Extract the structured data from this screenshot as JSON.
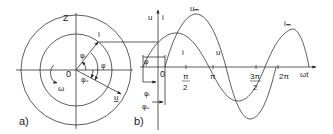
{
  "figure_a": {
    "panel_label": "a)",
    "z_label": "Z",
    "origin_label": "0",
    "omega_label": "ω",
    "vector_i_label": "i",
    "vector_u_label": "u",
    "phi_i_label": "φᵢ",
    "phi_label": "φ",
    "phi_u_label": "φᵤ"
  },
  "figure_b": {
    "panel_label": "b)",
    "y_axis_label_u": "u",
    "y_axis_label_i": "i",
    "x_axis_label": "ωt",
    "origin_label": "0",
    "curve_i_label": "i",
    "curve_u_label": "u",
    "u_max_label": "uₘ",
    "i_max_label": "iₘ",
    "phi_label": "φ",
    "phi_i_label": "φᵢ",
    "phi_u_label": "φᵤ",
    "ticks": {
      "pi_half_num": "π",
      "pi_half_den": "2",
      "pi": "π",
      "three_pi_half_num": "3π",
      "three_pi_half_den": "2",
      "two_pi": "2π"
    }
  },
  "colors": {
    "line": "#333333",
    "background": "#ffffff"
  }
}
